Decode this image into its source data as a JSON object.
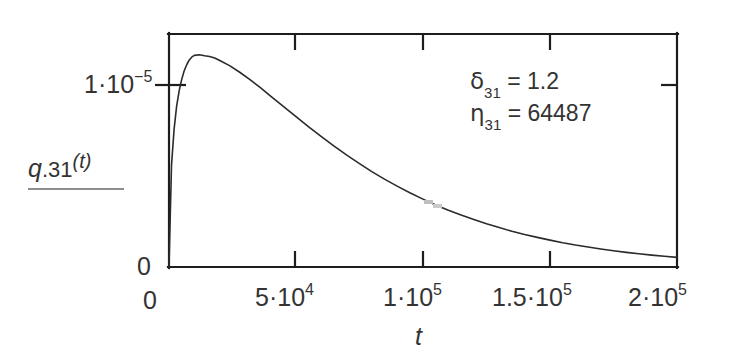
{
  "figure": {
    "background": "#ffffff",
    "ink_color": "#2b2b2b",
    "axis_color": "#1d1d1d"
  },
  "axis_titles": {
    "x": "t",
    "y_var": "q",
    "y_index": ".31",
    "y_arg": "(t)",
    "y_full": "q.31(t)"
  },
  "annotations": {
    "delta_symbol": "δ",
    "delta_sub": "31",
    "delta_eq": " = 1.2",
    "delta_value": 1.2,
    "delta_full": "δ31 = 1.2",
    "eta_symbol": "η",
    "eta_sub": "31",
    "eta_eq": " = 64487",
    "eta_value": 64487,
    "eta_full": "η31 = 64487"
  },
  "x_ticks": [
    {
      "value": 0,
      "mantissa": "0",
      "has_exp": false,
      "exp": "",
      "label": "0"
    },
    {
      "value": 50000,
      "mantissa": "5·10",
      "has_exp": true,
      "exp": "4",
      "label": "5·10^4"
    },
    {
      "value": 100000,
      "mantissa": "1·10",
      "has_exp": true,
      "exp": "5",
      "label": "1·10^5"
    },
    {
      "value": 150000,
      "mantissa": "1.5·10",
      "has_exp": true,
      "exp": "5",
      "label": "1.5·10^5"
    },
    {
      "value": 200000,
      "mantissa": "2·10",
      "has_exp": true,
      "exp": "5",
      "label": "2·10^5"
    }
  ],
  "y_ticks": [
    {
      "value": 0.0,
      "mantissa": "0",
      "has_exp": false,
      "exp": "",
      "label": "0"
    },
    {
      "value": 1e-05,
      "mantissa": "1·10",
      "has_exp": true,
      "exp": "−5",
      "label": "1·10^−5"
    }
  ],
  "chart_data": {
    "type": "line",
    "title": "",
    "xlabel": "t",
    "ylabel": "q.31(t)",
    "xlim": [
      0,
      200000
    ],
    "ylim": [
      0,
      1.284e-05
    ],
    "grid": false,
    "legend": null,
    "series": [
      {
        "name": "q.31(t)",
        "color": "#2b2b2b",
        "line_width": 1.6,
        "x": [
          0,
          1000,
          2000,
          3000,
          4000,
          5000,
          6000,
          7000,
          8000,
          9000,
          10000,
          12000,
          14000,
          16000,
          18000,
          20000,
          24000,
          28000,
          32000,
          36000,
          40000,
          45000,
          50000,
          55000,
          60000,
          65000,
          70000,
          75000,
          80000,
          85000,
          90000,
          95000,
          100000,
          105000,
          110000,
          115000,
          120000,
          125000,
          130000,
          135000,
          140000,
          145000,
          150000,
          155000,
          160000,
          165000,
          170000,
          175000,
          180000,
          185000,
          190000,
          195000,
          200000
        ],
        "y": [
          0.0,
          5.6e-06,
          7.6e-06,
          8.85e-06,
          9.72e-06,
          1.034e-05,
          1.081e-05,
          1.116e-05,
          1.141e-05,
          1.158e-05,
          1.166e-05,
          1.17e-05,
          1.164e-05,
          1.16e-05,
          1.152e-05,
          1.138e-05,
          1.108e-05,
          1.072e-05,
          1.031e-05,
          9.88e-06,
          9.42e-06,
          8.85e-06,
          8.28e-06,
          7.72e-06,
          7.18e-06,
          6.66e-06,
          6.16e-06,
          5.69e-06,
          5.24e-06,
          4.83e-06,
          4.44e-06,
          4.08e-06,
          3.74e-06,
          3.42e-06,
          3.13e-06,
          2.86e-06,
          2.61e-06,
          2.38e-06,
          2.17e-06,
          1.97e-06,
          1.79e-06,
          1.63e-06,
          1.48e-06,
          1.34e-06,
          1.21e-06,
          1.1e-06,
          9.9e-07,
          8.95e-07,
          8.07e-07,
          7.28e-07,
          6.56e-07,
          5.9e-07,
          5.3e-07
        ],
        "peak_x": 11500,
        "peak_y": 1.17e-05,
        "description": "unimodal right-skewed decay curve"
      }
    ]
  }
}
